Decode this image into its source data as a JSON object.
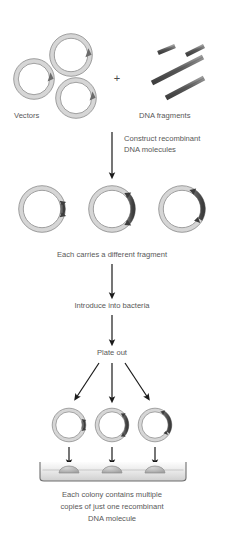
{
  "figure": {
    "background": "#ffffff",
    "width": 225,
    "height": 538
  },
  "colors": {
    "vector_band": "#d8d8d8",
    "vector_outline": "#7a7a7a",
    "insert_dark": "#4f4f4f",
    "fragment_dark": "#545454",
    "fragment_light": "#8e8e8e",
    "arrow": "#1a1a1a",
    "text": "#585858",
    "dish_fill": "#e9e9e9",
    "dish_outline": "#6e6e6e",
    "colony": "#b4b4b4"
  },
  "labels": {
    "vectors": "Vectors",
    "plus": "+",
    "dna_fragments": "DNA fragments",
    "construct_line1": "Construct recombinant",
    "construct_line2": "DNA molecules",
    "each_carries": "Each carries a different fragment",
    "introduce": "Introduce into bacteria",
    "plate_out": "Plate out",
    "caption_line1": "Each colony contains multiple",
    "caption_line2": "copies of just one recombinant",
    "caption_line3": "DNA molecule"
  },
  "stages": [
    {
      "name": "vectors",
      "kind": "plasmid-group",
      "count": 3,
      "description": "Three empty circular vector plasmids"
    },
    {
      "name": "dna-fragments",
      "kind": "fragment-group",
      "count": 4,
      "description": "Four linear DNA fragments of differing length"
    },
    {
      "name": "recombinant-plasmids",
      "kind": "plasmid-group",
      "count": 3,
      "description": "Three recombinant plasmids each carrying a different insert"
    },
    {
      "name": "transformed-plasmids",
      "kind": "plasmid-group",
      "count": 3,
      "description": "Three recombinant plasmids entering bacteria"
    },
    {
      "name": "petri-dish",
      "kind": "dish",
      "colonies": 3,
      "description": "Agar plate bearing three bacterial colonies"
    }
  ],
  "vectors": [
    {
      "id": "vector-1",
      "cx": 34,
      "cy": 79,
      "r": 18
    },
    {
      "id": "vector-2",
      "cx": 71,
      "cy": 55,
      "r": 19
    },
    {
      "id": "vector-3",
      "cx": 76,
      "cy": 98,
      "r": 18
    }
  ],
  "fragments": [
    {
      "id": "fragment-1",
      "x1": 158,
      "y1": 53,
      "x2": 175,
      "y2": 46,
      "width": 4
    },
    {
      "id": "fragment-2",
      "x1": 152,
      "y1": 83,
      "x2": 203,
      "y2": 57,
      "width": 5
    },
    {
      "id": "fragment-3",
      "x1": 166,
      "y1": 98,
      "x2": 204,
      "y2": 78,
      "width": 5
    },
    {
      "id": "fragment-4",
      "x1": 186,
      "y1": 55,
      "x2": 204,
      "y2": 46,
      "width": 4
    }
  ],
  "recombinant_plasmids": [
    {
      "id": "recombinant-1",
      "cx": 42,
      "cy": 209,
      "r": 21,
      "insert_start": -16,
      "insert_end": 16
    },
    {
      "id": "recombinant-2",
      "cx": 112,
      "cy": 209,
      "r": 21,
      "insert_start": -42,
      "insert_end": 42
    },
    {
      "id": "recombinant-3",
      "cx": 182,
      "cy": 209,
      "r": 21,
      "insert_start": -58,
      "insert_end": 30
    }
  ],
  "transformed_plasmids": [
    {
      "id": "transformed-1",
      "cx": 69,
      "cy": 425,
      "r": 15,
      "insert_start": -16,
      "insert_end": 16
    },
    {
      "id": "transformed-2",
      "cx": 112,
      "cy": 425,
      "r": 15,
      "insert_start": -42,
      "insert_end": 42
    },
    {
      "id": "transformed-3",
      "cx": 155,
      "cy": 425,
      "r": 15,
      "insert_start": -58,
      "insert_end": 30
    }
  ],
  "colonies": [
    {
      "id": "colony-1",
      "cx": 69,
      "cy": 473,
      "rx": 10,
      "ry": 6
    },
    {
      "id": "colony-2",
      "cx": 112,
      "cy": 473,
      "rx": 10,
      "ry": 6
    },
    {
      "id": "colony-3",
      "cx": 155,
      "cy": 473,
      "rx": 10,
      "ry": 6
    }
  ],
  "dish": {
    "left": 40,
    "right": 186,
    "top": 462,
    "bottom": 480
  },
  "arrows": [
    {
      "id": "arrow-construct",
      "x1": 112,
      "y1": 132,
      "x2": 112,
      "y2": 176
    },
    {
      "id": "arrow-to-introduce",
      "x1": 112,
      "y1": 262,
      "x2": 112,
      "y2": 296
    },
    {
      "id": "arrow-to-plate",
      "x1": 112,
      "y1": 313,
      "x2": 112,
      "y2": 343
    },
    {
      "id": "arrow-split-left",
      "x1": 98,
      "y1": 363,
      "x2": 74,
      "y2": 400
    },
    {
      "id": "arrow-split-center",
      "x1": 112,
      "y1": 363,
      "x2": 112,
      "y2": 400
    },
    {
      "id": "arrow-split-right",
      "x1": 126,
      "y1": 363,
      "x2": 150,
      "y2": 400
    },
    {
      "id": "arrow-colony-left",
      "x1": 69,
      "y1": 446,
      "x2": 69,
      "y2": 462
    },
    {
      "id": "arrow-colony-center",
      "x1": 112,
      "y1": 446,
      "x2": 112,
      "y2": 462
    },
    {
      "id": "arrow-colony-right",
      "x1": 155,
      "y1": 446,
      "x2": 155,
      "y2": 462
    }
  ]
}
